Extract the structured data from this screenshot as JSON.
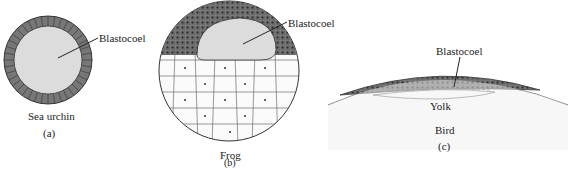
{
  "panels": [
    {
      "id": "a",
      "organism": "Sea urchin",
      "letter": "(a)",
      "label": "Blastocoel"
    },
    {
      "id": "b",
      "organism": "Frog",
      "letter": "(b)",
      "label": "Blastocoel"
    },
    {
      "id": "c",
      "organism": "Bird",
      "letter": "(c)",
      "label": "Blastocoel",
      "extra_label": "Yolk"
    }
  ],
  "colors": {
    "cell_dark": "#6e6e6e",
    "blastocoel": "#dcdcdc",
    "yolk": "#ececec",
    "outline": "#333333"
  }
}
